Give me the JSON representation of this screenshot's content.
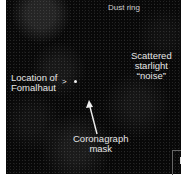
{
  "image": {
    "description": "Astronomical coronagraph image of Fomalhaut with annotation labels",
    "background_color": "#080808",
    "label_color": "#e6e6e6"
  },
  "labels": {
    "dust_ring": "Dust ring",
    "scattered_line1": "Scattered",
    "scattered_line2": "starlight",
    "scattered_line3": "“noise”",
    "location_line1": "Location of",
    "location_line2": "Fomalhaut",
    "location_pointer": ">",
    "coronagraph_line1": "Coronagraph",
    "coronagraph_line2": "mask"
  }
}
